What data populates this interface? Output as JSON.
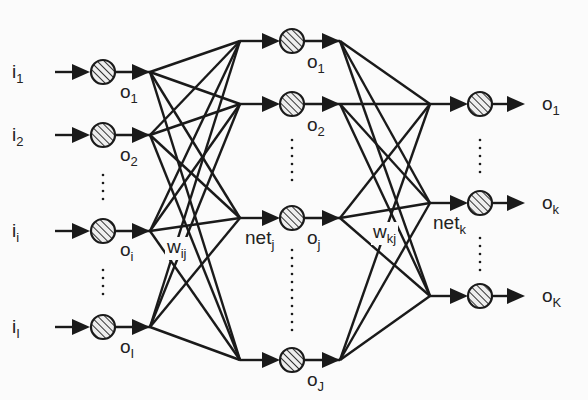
{
  "diagram": {
    "type": "three-layer feed-forward neural network",
    "layers": [
      {
        "name": "input",
        "nodes": [
          {
            "input": "i",
            "input_sub": "1",
            "output": "o",
            "output_sub": "1",
            "y": 72
          },
          {
            "input": "i",
            "input_sub": "2",
            "output": "o",
            "output_sub": "2",
            "y": 135
          },
          {
            "input": "i",
            "input_sub": "i",
            "output": "o",
            "output_sub": "i",
            "y": 231
          },
          {
            "input": "i",
            "input_sub": "I",
            "output": "o",
            "output_sub": "I",
            "y": 327
          }
        ]
      },
      {
        "name": "hidden",
        "nodes": [
          {
            "net": "",
            "output": "o",
            "output_sub": "1",
            "y": 41
          },
          {
            "net": "",
            "output": "o",
            "output_sub": "2",
            "y": 104
          },
          {
            "net": "net",
            "net_sub": "j",
            "output": "o",
            "output_sub": "j",
            "y": 218
          },
          {
            "net": "",
            "output": "o",
            "output_sub": "J",
            "y": 360
          }
        ]
      },
      {
        "name": "output",
        "nodes": [
          {
            "output": "o",
            "output_sub": "1",
            "y": 104
          },
          {
            "net": "net",
            "net_sub": "k",
            "output": "o",
            "output_sub": "k",
            "y": 203
          },
          {
            "output": "o",
            "output_sub": "K",
            "y": 296
          }
        ]
      }
    ],
    "weights": [
      {
        "label": "w",
        "sub": "ij"
      },
      {
        "label": "w",
        "sub": "kj"
      }
    ],
    "colors": {
      "line": "#1a1a1a",
      "background": "#fbfbfb",
      "node_fill": "#e8e8e8"
    }
  }
}
